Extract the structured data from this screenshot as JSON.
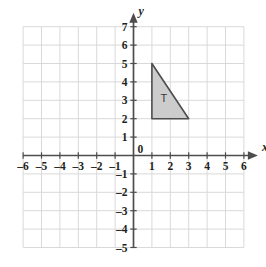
{
  "figure": {
    "kind": "coordinate-plane",
    "background_color": "#ffffff",
    "grid_color": "#d9d9d9",
    "axis_color": "#4d4d4d"
  },
  "axes": {
    "x": {
      "name": "x",
      "min": -6,
      "max": 6,
      "step": 1,
      "tick_labels": [
        "-6",
        "-5",
        "-4",
        "-3",
        "-2",
        "-1",
        "1",
        "2",
        "3",
        "4",
        "5",
        "6"
      ],
      "arrow": "right"
    },
    "y": {
      "name": "y",
      "min": -5,
      "max": 7,
      "step": 1,
      "tick_labels": [
        "7",
        "6",
        "5",
        "4",
        "3",
        "2",
        "1",
        "-1",
        "-2",
        "-3",
        "-4",
        "-5"
      ],
      "arrow": "up"
    },
    "origin_label": "0"
  },
  "chart_data": {
    "type": "scatter",
    "title": "",
    "xlabel": "x",
    "ylabel": "y",
    "xlim": [
      -6,
      6
    ],
    "ylim": [
      -5,
      7
    ],
    "grid": true,
    "legend": "none",
    "shapes": [
      {
        "name": "T",
        "label": "T",
        "type": "polygon",
        "vertices": [
          [
            1,
            5
          ],
          [
            1,
            2
          ],
          [
            3,
            2
          ]
        ],
        "fill": "#cccccc",
        "stroke": "#4d4d4d",
        "label_position": [
          1.65,
          3.05
        ]
      }
    ]
  }
}
